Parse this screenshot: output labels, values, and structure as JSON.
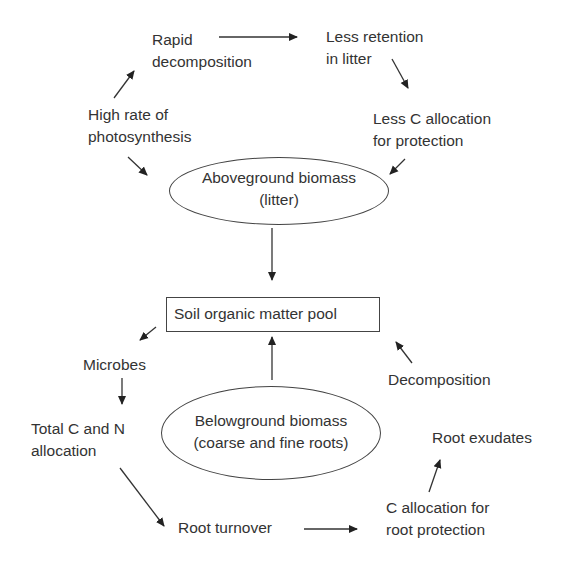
{
  "diagram": {
    "nodes": {
      "rapid_decomposition": [
        "Rapid",
        "decomposition"
      ],
      "less_retention": [
        "Less retention",
        "in litter"
      ],
      "high_photosynthesis": [
        "High rate of",
        "photosynthesis"
      ],
      "less_c_allocation": [
        "Less C allocation",
        "for protection"
      ],
      "aboveground_biomass": [
        "Aboveground biomass",
        "(litter)"
      ],
      "soil_pool": "Soil organic matter pool",
      "microbes": "Microbes",
      "decomposition": "Decomposition",
      "total_cn": [
        "Total C and N",
        "allocation"
      ],
      "belowground_biomass": [
        "Belowground biomass",
        "(coarse and fine roots)"
      ],
      "root_exudates": "Root exudates",
      "root_turnover": "Root turnover",
      "c_allocation_root": [
        "C allocation for",
        "root protection"
      ]
    },
    "edges": [
      {
        "from": "Rapid decomposition",
        "to": "Less retention in litter"
      },
      {
        "from": "Less retention in litter",
        "to": "Less C allocation for protection"
      },
      {
        "from": "Less C allocation for protection",
        "to": "Aboveground biomass (litter)"
      },
      {
        "from": "High rate of photosynthesis",
        "to": "Rapid decomposition"
      },
      {
        "from": "High rate of photosynthesis",
        "to": "Aboveground biomass (litter)"
      },
      {
        "from": "Aboveground biomass (litter)",
        "to": "Soil organic matter pool"
      },
      {
        "from": "Soil organic matter pool",
        "to": "Microbes"
      },
      {
        "from": "Microbes",
        "to": "Total C and N allocation"
      },
      {
        "from": "Total C and N allocation",
        "to": "Root turnover"
      },
      {
        "from": "Root turnover",
        "to": "C allocation for root protection"
      },
      {
        "from": "C allocation for root protection",
        "to": "Root exudates"
      },
      {
        "from": "Decomposition",
        "to": "Soil organic matter pool"
      },
      {
        "from": "Belowground biomass (coarse and fine roots)",
        "to": "Soil organic matter pool"
      }
    ]
  }
}
